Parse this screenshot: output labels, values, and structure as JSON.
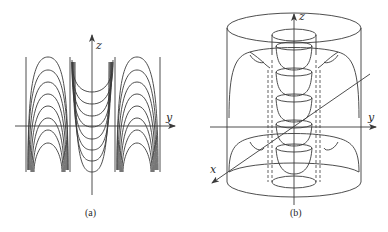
{
  "panels": [
    {
      "id": "a",
      "caption": "(a)",
      "axes": {
        "vertical": "z",
        "horizontal": "y"
      },
      "description": "Cross-section of field lines in the y-z plane: three columns separated by vertical lines; outer columns contain arch-shaped (cap) curves, middle column contains U-shaped (cup) curves."
    },
    {
      "id": "b",
      "caption": "(b)",
      "axes": {
        "vertical": "z",
        "horizontal": "y",
        "oblique": "x"
      },
      "description": "3D view: outer cylinder with top and bottom ellipses, inner cylinder (dashed hidden edges), stacked cup-shaped surfaces along z-axis, and toroidal dome surfaces."
    }
  ],
  "colors": {
    "line": "#3a3a3a",
    "background": "#ffffff"
  }
}
